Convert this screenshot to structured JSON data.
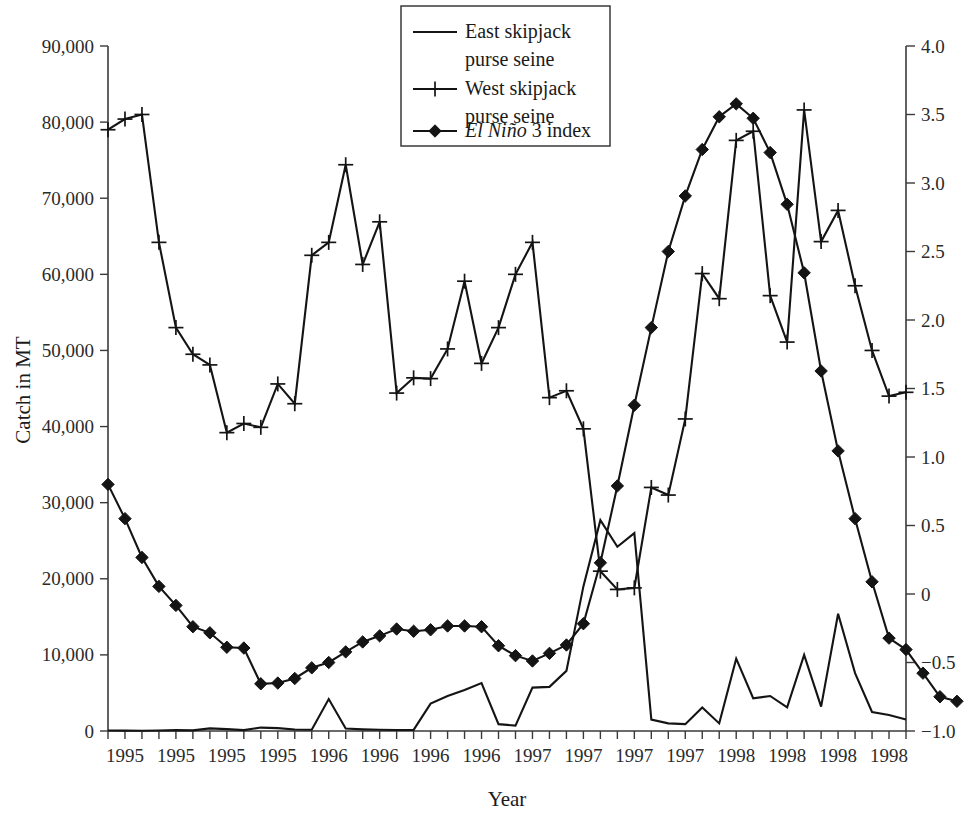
{
  "chart_data": {
    "type": "line",
    "title": "",
    "xlabel": "Year",
    "ylabel": "Catch in MT",
    "y2label": "",
    "ylim": [
      0,
      90000
    ],
    "y2lim": [
      -1.0,
      4.0
    ],
    "grid": false,
    "legend_position": "top-center",
    "y_ticks": [
      "0",
      "10,000",
      "20,000",
      "30,000",
      "40,000",
      "50,000",
      "60,000",
      "70,000",
      "80,000",
      "90,000"
    ],
    "y_tick_values": [
      0,
      10000,
      20000,
      30000,
      40000,
      50000,
      60000,
      70000,
      80000,
      90000
    ],
    "y2_ticks": [
      "-1.0",
      "-0.5",
      "0",
      "0.5",
      "1.0",
      "1.5",
      "2.0",
      "2.5",
      "3.0",
      "3.5",
      "4.0"
    ],
    "y2_tick_values": [
      -1.0,
      -0.5,
      0,
      0.5,
      1.0,
      1.5,
      2.0,
      2.5,
      3.0,
      3.5,
      4.0
    ],
    "x_tick_labels": [
      "1995",
      "1995",
      "1995",
      "1995",
      "1996",
      "1996",
      "1996",
      "1996",
      "1997",
      "1997",
      "1997",
      "1997",
      "1998",
      "1998",
      "1998",
      "1998"
    ],
    "x_label_positions": [
      1,
      4,
      7,
      10,
      13,
      16,
      19,
      22,
      25,
      28,
      31,
      34,
      37,
      40,
      43,
      46
    ],
    "x_minor_tick_count": 48,
    "legend": [
      {
        "label": "East skipjack purse seine",
        "line1": "East skipjack",
        "line2": "purse seine",
        "marker": "none"
      },
      {
        "label": "West skipjack purse seine",
        "line1": "West skipjack",
        "line2": "purse seine",
        "marker": "plus"
      },
      {
        "label": "El Nino 3 index",
        "line1_italic": "El Niño",
        "line1_rest": " 3 index",
        "marker": "diamond"
      }
    ],
    "series": [
      {
        "name": "East skipjack purse seine",
        "axis": "left",
        "marker": "none",
        "units": "MT",
        "values": [
          60,
          50,
          40,
          60,
          120,
          80,
          350,
          240,
          120,
          450,
          380,
          200,
          160,
          4200,
          320,
          220,
          160,
          140,
          150,
          3600,
          4600,
          5400,
          6300,
          900,
          700,
          5700,
          5800,
          7900,
          19000,
          27700,
          24200,
          26000,
          1500,
          1000,
          900,
          3100,
          1000,
          9500,
          4300,
          4600,
          3100,
          10000,
          3200,
          15400,
          7600,
          2500,
          2100,
          1500
        ]
      },
      {
        "name": "West skipjack purse seine",
        "axis": "left",
        "marker": "plus",
        "units": "MT",
        "values": [
          79000,
          80400,
          81000,
          64200,
          53000,
          49500,
          48100,
          39200,
          40400,
          39900,
          45600,
          43000,
          62500,
          64200,
          74400,
          61300,
          66900,
          44400,
          46400,
          46300,
          50200,
          59100,
          48300,
          53000,
          60000,
          64200,
          43800,
          44700,
          39700,
          21000,
          18600,
          18800,
          32000,
          31000,
          41000,
          60100,
          56800,
          77600,
          78800,
          57200,
          51100,
          81600,
          64300,
          68400,
          58500,
          50000,
          44000,
          44500
        ]
      },
      {
        "name": "El Nino 3 index",
        "axis": "right",
        "marker": "diamond",
        "units": "index",
        "values_left_scale": [
          32400,
          27900,
          22800,
          19000,
          16500,
          13700,
          12900,
          11000,
          10900,
          6200,
          6300,
          6900,
          8300,
          9000,
          10400,
          11700,
          12500,
          13400,
          13100,
          13300,
          13800,
          13800,
          13700,
          11200,
          9900,
          9200,
          10200,
          11300,
          14100,
          22100,
          32200,
          42800,
          53000,
          63000,
          70300,
          76400,
          80700,
          82400,
          80500,
          76000,
          69200,
          60200,
          47300,
          36800,
          27900,
          19600,
          12200,
          10700,
          7600,
          4500,
          3900
        ],
        "values": [
          0.8,
          0.55,
          0.27,
          0.06,
          -0.08,
          -0.24,
          -0.28,
          -0.39,
          -0.39,
          -0.66,
          -0.65,
          -0.62,
          -0.54,
          -0.5,
          -0.42,
          -0.35,
          -0.31,
          -0.26,
          -0.27,
          -0.26,
          -0.23,
          -0.23,
          -0.24,
          -0.38,
          -0.45,
          -0.49,
          -0.43,
          -0.37,
          -0.22,
          0.23,
          0.79,
          1.38,
          1.94,
          2.5,
          2.91,
          3.24,
          3.48,
          3.58,
          3.47,
          3.22,
          2.84,
          2.34,
          1.63,
          1.04,
          0.55,
          0.09,
          -0.32,
          -0.4,
          -0.58,
          -0.75,
          -0.78
        ]
      }
    ]
  }
}
